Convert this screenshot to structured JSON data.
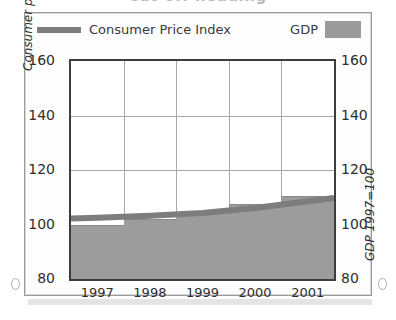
{
  "title_strip": {
    "ghost_text": "cut-off heading"
  },
  "legend": {
    "cpi_label": "Consumer Price Index",
    "gdp_label": "GDP",
    "cpi_color": "#7d7d7d",
    "gdp_color": "#9a9a9a"
  },
  "axes": {
    "left_title": "Consumer price index 1995=100",
    "right_title": "GDP 1997=100",
    "left_ticks": [
      "160",
      "140",
      "120",
      "100",
      "80"
    ],
    "right_ticks": [
      "160",
      "140",
      "120",
      "100",
      "80"
    ],
    "x_ticks": [
      "1997",
      "1998",
      "1999",
      "2000",
      "2001"
    ]
  },
  "chart_data": {
    "type": "bar",
    "title": "",
    "subtitle": "",
    "xlabel": "",
    "ylabel": "Consumer price index 1995=100",
    "y2label": "GDP 1997=100",
    "categories": [
      "1997",
      "1998",
      "1999",
      "2000",
      "2001"
    ],
    "ylim": [
      80,
      160
    ],
    "y2lim": [
      80,
      160
    ],
    "yticks": [
      80,
      100,
      120,
      140,
      160
    ],
    "grid": true,
    "legend_position": "top",
    "series": [
      {
        "name": "GDP",
        "type": "bar",
        "color": "#9c9c9c",
        "values": [
          100.0,
          102.0,
          104.5,
          107.5,
          110.5
        ]
      },
      {
        "name": "Consumer Price Index",
        "type": "line",
        "color": "#7d7d7d",
        "values": [
          102.5,
          103.2,
          104.2,
          106.0,
          108.5
        ]
      }
    ]
  }
}
